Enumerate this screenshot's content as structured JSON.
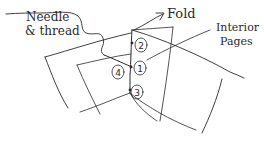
{
  "diagram": {
    "type": "hand-drawn sketch",
    "labels": {
      "needle": "Needle",
      "thread": "& thread",
      "fold": "Fold",
      "interior_1": "Interior",
      "interior_2": "Pages"
    },
    "stitch_holes": [
      {
        "id": "hole-2",
        "label": "2"
      },
      {
        "id": "hole-1",
        "label": "1"
      },
      {
        "id": "hole-3",
        "label": "3"
      },
      {
        "id": "hole-4",
        "label": "4"
      }
    ],
    "ink_color": "#2a2a2a",
    "background": "#ffffff"
  }
}
